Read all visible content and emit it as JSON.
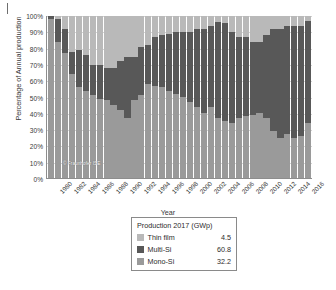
{
  "figure": {
    "page_edge_mark": "",
    "watermark": "© Fraunhofer ISE"
  },
  "legend": {
    "title": "Production 2017 (GWp)",
    "entries": [
      {
        "label": "Thin film",
        "value": "4.5",
        "color": "#b9b9b9",
        "swatch_name": "legend-swatch-thin-film"
      },
      {
        "label": "Multi-Si",
        "value": "60.8",
        "color": "#585858",
        "swatch_name": "legend-swatch-multi-si"
      },
      {
        "label": "Mono-Si",
        "value": "32.2",
        "color": "#9a9a9a",
        "swatch_name": "legend-swatch-mono-si"
      }
    ]
  },
  "chart_data": {
    "type": "bar",
    "subtype": "stacked-percentage",
    "title": "",
    "xlabel": "Year",
    "ylabel": "Percentage of Annual production",
    "ylim": [
      0,
      100
    ],
    "ytick_labels": [
      "0%",
      "10%",
      "20%",
      "30%",
      "40%",
      "50%",
      "60%",
      "70%",
      "80%",
      "90%",
      "100%"
    ],
    "ytick_values": [
      0,
      10,
      20,
      30,
      40,
      50,
      60,
      70,
      80,
      90,
      100
    ],
    "grid": true,
    "grid_axis": "y",
    "legend_position": "below-plot",
    "xtick_labels": [
      "1980",
      "1982",
      "1984",
      "1986",
      "1988",
      "1990",
      "1992",
      "1994",
      "1996",
      "1998",
      "2000",
      "2002",
      "2004",
      "2006",
      "2008",
      "2010",
      "2012",
      "2014",
      "2016"
    ],
    "categories": [
      "1980",
      "1981",
      "1982",
      "1983",
      "1984",
      "1985",
      "1986",
      "1987",
      "1988",
      "1989",
      "1990",
      "1991",
      "1992",
      "1993",
      "1994",
      "1995",
      "1996",
      "1997",
      "1998",
      "1999",
      "2000",
      "2001",
      "2002",
      "2003",
      "2004",
      "2005",
      "2006",
      "2007",
      "2008",
      "2009",
      "2010",
      "2011",
      "2012",
      "2013",
      "2014",
      "2015",
      "2016",
      "2017"
    ],
    "series": [
      {
        "name": "Mono-Si",
        "color": "#9a9a9a",
        "values": [
          98,
          84,
          77,
          64,
          56,
          54,
          51,
          49,
          48,
          45,
          42,
          37,
          48,
          51,
          58,
          57,
          56,
          54,
          52,
          50,
          47,
          44,
          40,
          44,
          37,
          35,
          34,
          37,
          38,
          39,
          40,
          37,
          29,
          25,
          27,
          25,
          26,
          34
        ]
      },
      {
        "name": "Multi-Si",
        "color": "#585858",
        "values": [
          2,
          14,
          15,
          14,
          23,
          22,
          19,
          21,
          20,
          23,
          30,
          38,
          27,
          30,
          24,
          30,
          32,
          35,
          38,
          40,
          43,
          48,
          52,
          50,
          59,
          61,
          56,
          50,
          49,
          45,
          44,
          51,
          63,
          67,
          67,
          69,
          68,
          63
        ]
      },
      {
        "name": "Thin film",
        "color": "#b9b9b9",
        "values": [
          0,
          2,
          8,
          22,
          21,
          24,
          30,
          30,
          32,
          32,
          28,
          25,
          25,
          19,
          18,
          13,
          12,
          11,
          10,
          10,
          10,
          8,
          8,
          6,
          4,
          4,
          10,
          13,
          13,
          16,
          16,
          12,
          8,
          8,
          6,
          6,
          6,
          3
        ]
      }
    ]
  }
}
